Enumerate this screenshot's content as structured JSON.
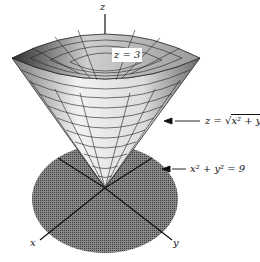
{
  "figure": {
    "axes": {
      "z": "z",
      "x": "x",
      "y": "y"
    },
    "labels": {
      "top_plane": "z = 3",
      "cone_eq_prefix": "z = ",
      "cone_eq_radicand": "x² + y²",
      "circle_eq": "x² + y² = 9"
    },
    "colors": {
      "disk": "#6a6a6a",
      "cone_light": "#e6e6e6",
      "cone_dark": "#555555",
      "grid": "#222222"
    }
  }
}
